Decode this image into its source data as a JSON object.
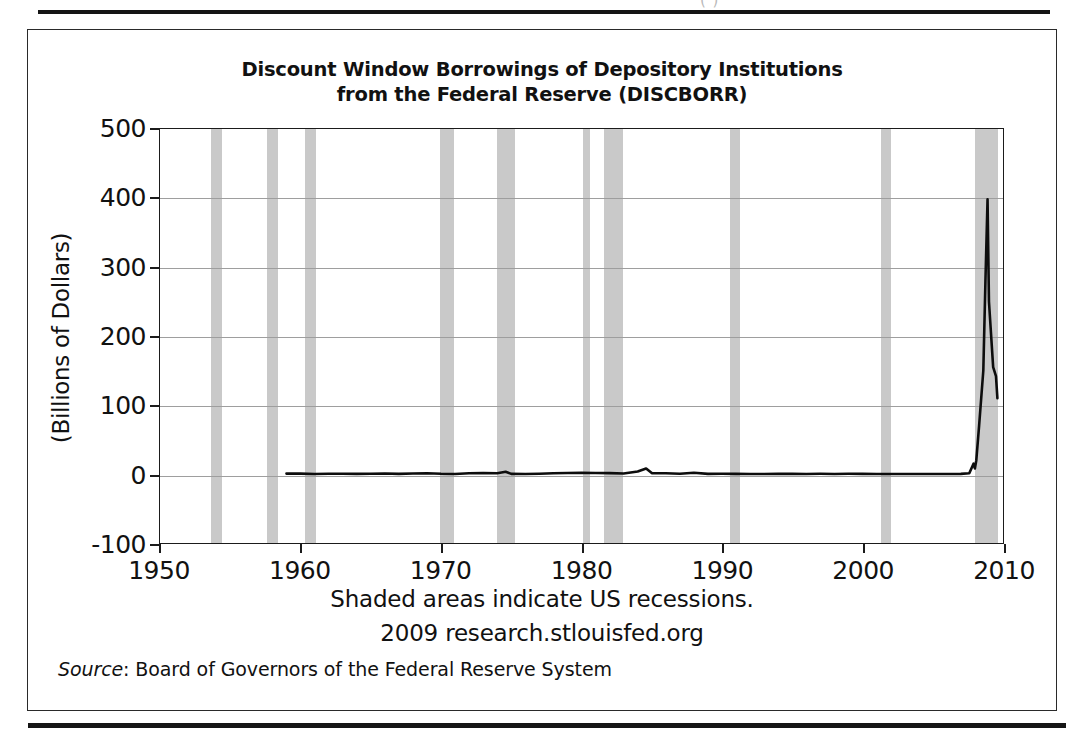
{
  "page": {
    "top_cutoff_text": "(                                 )"
  },
  "figure": {
    "chart_title_line1": "Discount Window Borrowings of Depository Institutions",
    "chart_title_line2": "from the Federal Reserve (DISCBORR)",
    "y_caption": "(Billions of Dollars)",
    "footnote_recessions": "Shaded areas indicate US recessions.",
    "footnote_source_site": "2009 research.stlouisfed.org",
    "source_label": "Source",
    "source_separator": ": ",
    "source_text": "Board of Governors of the Federal Reserve System"
  },
  "colors": {
    "line": "#0d0d0d",
    "recession_band": "#c9c9c9",
    "gridline": "#9e9e9e",
    "axis": "#1b1b1b",
    "page_rule": "#151515"
  },
  "chart_data": {
    "type": "line",
    "title": "Discount Window Borrowings of Depository Institutions from the Federal Reserve (DISCBORR)",
    "xlabel": "",
    "ylabel": "(Billions of Dollars)",
    "xlim": [
      1950,
      2010
    ],
    "ylim": [
      -100,
      500
    ],
    "xticks": [
      1950,
      1960,
      1970,
      1980,
      1990,
      2000,
      2010
    ],
    "xtick_labels": [
      "1950",
      "1960",
      "1970",
      "1980",
      "1990",
      "2000",
      "2010"
    ],
    "yticks": [
      -100,
      0,
      100,
      200,
      300,
      400,
      500
    ],
    "ytick_labels": [
      "-100",
      "0",
      "100",
      "200",
      "300",
      "400",
      "500"
    ],
    "grid": "horizontal",
    "legend": "none",
    "series": [
      {
        "name": "DISCBORR",
        "x": [
          1959.0,
          1960.0,
          1961.0,
          1962.0,
          1963.0,
          1964.0,
          1965.0,
          1966.0,
          1967.0,
          1968.0,
          1969.0,
          1970.0,
          1971.0,
          1972.0,
          1973.0,
          1974.0,
          1974.6,
          1975.0,
          1976.0,
          1977.0,
          1978.0,
          1979.0,
          1980.0,
          1981.0,
          1982.0,
          1983.0,
          1984.0,
          1984.6,
          1985.0,
          1986.0,
          1987.0,
          1988.0,
          1989.0,
          1990.0,
          1991.0,
          1992.0,
          1993.0,
          1994.0,
          1995.0,
          1996.0,
          1997.0,
          1998.0,
          1999.0,
          2000.0,
          2001.0,
          2002.0,
          2003.0,
          2004.0,
          2005.0,
          2006.0,
          2007.0,
          2007.6,
          2007.9,
          2008.0,
          2008.1,
          2008.3,
          2008.6,
          2008.75,
          2008.9,
          2009.0,
          2009.3,
          2009.5,
          2009.6
        ],
        "y": [
          0.6,
          0.5,
          0.1,
          0.3,
          0.3,
          0.2,
          0.4,
          0.7,
          0.2,
          0.7,
          1.1,
          0.3,
          0.1,
          1.0,
          1.3,
          1.0,
          3.3,
          0.2,
          0.1,
          0.4,
          1.1,
          1.4,
          1.6,
          1.5,
          1.2,
          0.8,
          3.5,
          8.0,
          1.3,
          1.0,
          0.3,
          1.7,
          0.2,
          0.3,
          0.2,
          0.1,
          0.1,
          0.2,
          0.2,
          0.1,
          0.3,
          0.1,
          0.3,
          0.2,
          0.1,
          0.1,
          0.1,
          0.1,
          0.1,
          0.1,
          0.2,
          1.0,
          15.0,
          8.0,
          20.0,
          70.0,
          150.0,
          280.0,
          398.0,
          250.0,
          155.0,
          142.0,
          110.0
        ],
        "color": "#0d0d0d"
      }
    ],
    "recession_bands": [
      {
        "start": 1953.6,
        "end": 1954.4
      },
      {
        "start": 1957.6,
        "end": 1958.4
      },
      {
        "start": 1960.3,
        "end": 1961.1
      },
      {
        "start": 1969.9,
        "end": 1970.9
      },
      {
        "start": 1973.9,
        "end": 1975.2
      },
      {
        "start": 1980.0,
        "end": 1980.5
      },
      {
        "start": 1981.5,
        "end": 1982.9
      },
      {
        "start": 1990.5,
        "end": 1991.2
      },
      {
        "start": 2001.2,
        "end": 2001.9
      },
      {
        "start": 2007.9,
        "end": 2009.5
      }
    ]
  }
}
